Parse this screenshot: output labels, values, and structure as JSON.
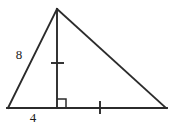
{
  "figure": {
    "name": "triangle-with-altitude",
    "background_color": "#ffffff",
    "stroke_color": "#2b2b2b",
    "label_color": "#1a1a1a",
    "vertices": {
      "apex": {
        "x": 57,
        "y": 9
      },
      "left": {
        "x": 8,
        "y": 108
      },
      "right": {
        "x": 166,
        "y": 108
      },
      "foot": {
        "x": 57,
        "y": 108
      }
    },
    "segments": [
      {
        "name": "left-side",
        "x1": 8,
        "y1": 108,
        "x2": 57,
        "y2": 9
      },
      {
        "name": "right-side",
        "x1": 57,
        "y1": 9,
        "x2": 166,
        "y2": 108
      },
      {
        "name": "base",
        "x1": 8,
        "y1": 108,
        "x2": 166,
        "y2": 108
      },
      {
        "name": "altitude",
        "x1": 57,
        "y1": 9,
        "x2": 57,
        "y2": 108
      }
    ],
    "labels": {
      "left_side_length": "8",
      "left_side_label_x": 19,
      "left_side_label_y": 59,
      "base_segment_length": "4",
      "base_segment_label_x": 33,
      "base_segment_label_y": 122
    },
    "tick_marks": [
      {
        "name": "altitude-tick",
        "orientation": "horizontal",
        "x1": 51,
        "y1": 63,
        "x2": 64,
        "y2": 63
      },
      {
        "name": "base-tick",
        "orientation": "vertical",
        "x1": 100,
        "y1": 101,
        "x2": 100,
        "y2": 114
      }
    ],
    "right_angle_marker": {
      "name": "right-angle-square",
      "x": 57,
      "y": 99,
      "size": 9
    }
  }
}
